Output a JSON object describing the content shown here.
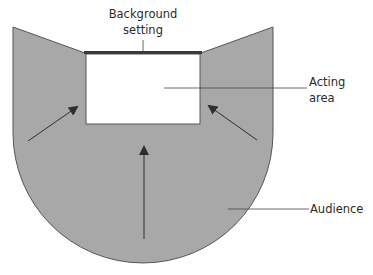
{
  "diagram": {
    "type": "theatre-stage-layout",
    "labels": {
      "background_setting": {
        "line1": "Background",
        "line2": "setting"
      },
      "acting_area": {
        "line1": "Acting",
        "line2": "area"
      },
      "audience": "Audience"
    },
    "arrows": [
      {
        "direction": "toward-acting-area",
        "from": "left-audience"
      },
      {
        "direction": "toward-acting-area",
        "from": "right-audience"
      },
      {
        "direction": "toward-acting-area",
        "from": "center-audience"
      }
    ],
    "colors": {
      "audience_fill": "#a8a8a8",
      "outline": "#555555",
      "acting_area_fill": "#ffffff",
      "backdrop": "#3a3a3a",
      "text": "#2a2a2a"
    }
  }
}
